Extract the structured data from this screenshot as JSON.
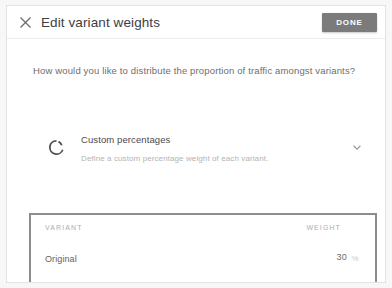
{
  "dialog": {
    "close_icon": "close-icon",
    "title": "Edit variant weights",
    "done_label": "DONE",
    "done_color": "#7b7b7b"
  },
  "body": {
    "question": "How would you like to distribute the proportion of traffic amongst variants?"
  },
  "strategy": {
    "icon": "pie-chart-icon",
    "title": "Custom percentages",
    "subtitle": "Define a custom percentage weight of each variant.",
    "caret_icon": "chevron-down-icon"
  },
  "table": {
    "columns": [
      "VARIANT",
      "WEIGHT"
    ],
    "percent_symbol": "%",
    "rows": [
      {
        "variant": "Original",
        "weight": "30",
        "focused": false
      },
      {
        "variant": "Variant 1",
        "weight": "70",
        "focused": true
      }
    ]
  },
  "total": {
    "value": "100.0",
    "percent_symbol": "%"
  }
}
